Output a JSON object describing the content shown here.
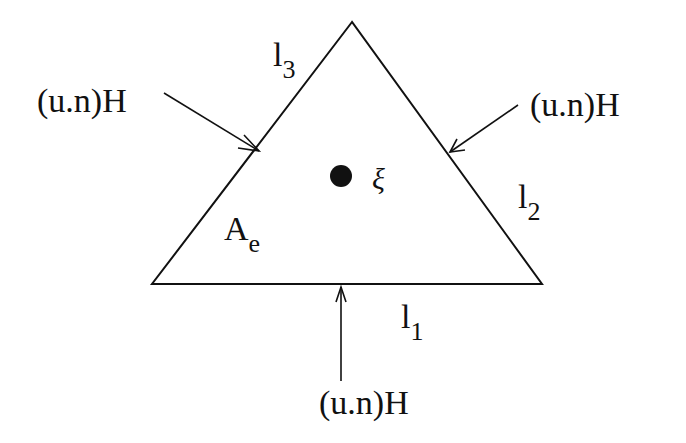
{
  "diagram": {
    "type": "triangular element with boundary fluxes",
    "element_label": {
      "main": "A",
      "sub": "e"
    },
    "source_point_label": "ξ",
    "edges": [
      {
        "main": "l",
        "sub": "1"
      },
      {
        "main": "l",
        "sub": "2"
      },
      {
        "main": "l",
        "sub": "3"
      }
    ],
    "flux_labels": {
      "left": "(u.n)H",
      "right": "(u.n)H",
      "bottom": "(u.n)H"
    },
    "colors": {
      "stroke": "#111111",
      "background": "#ffffff"
    }
  }
}
